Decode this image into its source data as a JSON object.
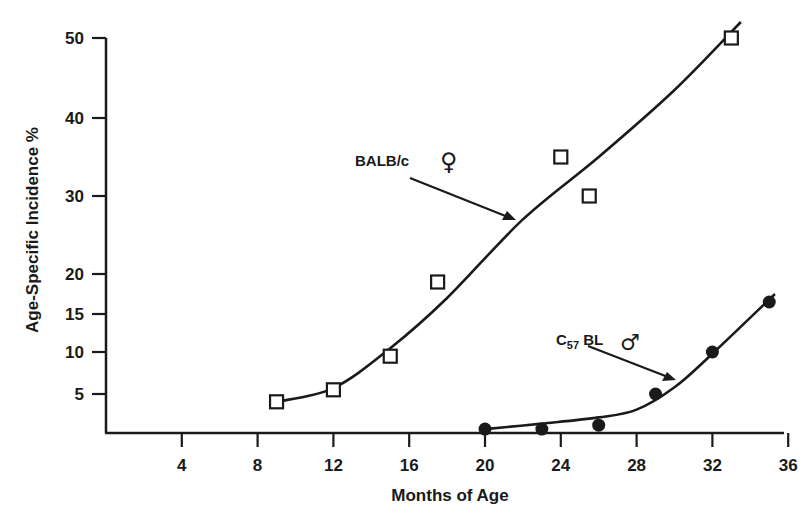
{
  "chart_data": {
    "type": "scatter",
    "title": "",
    "xlabel": "Months of Age",
    "ylabel": "Age-Specific Incidence %",
    "xlim": [
      0,
      36
    ],
    "ylim": [
      0,
      50
    ],
    "x_ticks": [
      4,
      8,
      12,
      16,
      20,
      24,
      28,
      32,
      36
    ],
    "y_ticks": [
      5,
      10,
      15,
      20,
      30,
      40,
      50
    ],
    "grid": false,
    "legend": "none (inline annotations with arrows)",
    "series": [
      {
        "name": "BALB/c ♀",
        "marker": "open-square",
        "points": [
          {
            "x": 9,
            "y": 4
          },
          {
            "x": 12,
            "y": 5.5
          },
          {
            "x": 15,
            "y": 9.5
          },
          {
            "x": 17.5,
            "y": 19
          },
          {
            "x": 24,
            "y": 35
          },
          {
            "x": 25.5,
            "y": 30
          },
          {
            "x": 33,
            "y": 50
          }
        ],
        "fit_curve": [
          {
            "x": 9,
            "y": 4
          },
          {
            "x": 12,
            "y": 5.7
          },
          {
            "x": 15,
            "y": 10.5
          },
          {
            "x": 18,
            "y": 17
          },
          {
            "x": 22,
            "y": 27
          },
          {
            "x": 26,
            "y": 35
          },
          {
            "x": 30,
            "y": 43.5
          },
          {
            "x": 33.5,
            "y": 52
          }
        ]
      },
      {
        "name": "C57 BL ♂",
        "marker": "filled-circle",
        "points": [
          {
            "x": 20,
            "y": 0.5
          },
          {
            "x": 23,
            "y": 0.5
          },
          {
            "x": 26,
            "y": 1
          },
          {
            "x": 29,
            "y": 5
          },
          {
            "x": 32,
            "y": 10
          },
          {
            "x": 35,
            "y": 16.5
          }
        ],
        "fit_curve": [
          {
            "x": 20,
            "y": 0.5
          },
          {
            "x": 23,
            "y": 1.2
          },
          {
            "x": 26,
            "y": 2
          },
          {
            "x": 28,
            "y": 3
          },
          {
            "x": 30,
            "y": 5.8
          },
          {
            "x": 32,
            "y": 9.8
          },
          {
            "x": 35.3,
            "y": 17.5
          }
        ]
      }
    ],
    "annotations": [
      {
        "text": "BALB/c",
        "symbol": "♀",
        "points_to": {
          "x": 21.8,
          "y": 27
        }
      },
      {
        "text": "C",
        "subscript": "57",
        "text_after": " BL",
        "symbol": "♂",
        "points_to": {
          "x": 30.5,
          "y": 6.5
        }
      }
    ]
  }
}
